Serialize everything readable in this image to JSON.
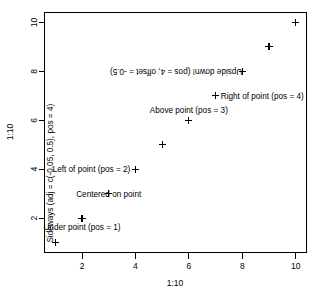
{
  "chart_data": {
    "type": "scatter",
    "title": "",
    "xlabel": "1:10",
    "ylabel": "1:10",
    "xlim": [
      0.595,
      10.405
    ],
    "ylim": [
      0.595,
      10.405
    ],
    "xticks": [
      2,
      4,
      6,
      8,
      10
    ],
    "yticks": [
      2,
      4,
      6,
      8,
      10
    ],
    "xticklabels": [
      "2",
      "4",
      "6",
      "8",
      "10"
    ],
    "yticklabels": [
      "2",
      "4",
      "6",
      "8",
      "10"
    ],
    "grid": false,
    "legend": false,
    "marker": "plus",
    "marker_color": "#000000",
    "x": [
      1,
      2,
      3,
      4,
      5,
      6,
      7,
      8,
      9,
      10
    ],
    "y": [
      1,
      2,
      3,
      4,
      5,
      6,
      7,
      8,
      9,
      10
    ],
    "series": [
      {
        "name": "1:10",
        "values": [
          1,
          2,
          3,
          4,
          5,
          6,
          7,
          8,
          9,
          10
        ]
      }
    ],
    "annotations": [
      {
        "text": "Sideways (adj = c(-0.05, 0.5), pos = 4)",
        "x": 1,
        "y": 1,
        "rotation": 90,
        "placement": "left-rotated"
      },
      {
        "text": "Under point (pos = 1)",
        "x": 2,
        "y": 2,
        "rotation": 0,
        "placement": "below"
      },
      {
        "text": "Centered on point",
        "x": 3,
        "y": 3,
        "rotation": 0,
        "placement": "center"
      },
      {
        "text": "Left of point (pos = 2)",
        "x": 4,
        "y": 4,
        "rotation": 0,
        "placement": "left"
      },
      {
        "text": "Above point (pos = 3)",
        "x": 6,
        "y": 6,
        "rotation": 0,
        "placement": "above"
      },
      {
        "text": "Right of point (pos = 4)",
        "x": 7,
        "y": 7,
        "rotation": 0,
        "placement": "right"
      },
      {
        "text": "Upside down! (pos = 4, offset = -0.5)",
        "x": 8,
        "y": 8,
        "rotation": 180,
        "placement": "upside-down"
      }
    ]
  }
}
